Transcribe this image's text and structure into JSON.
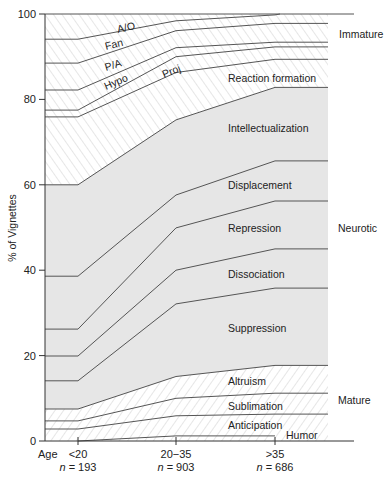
{
  "chart_data": {
    "type": "area",
    "title": "",
    "xlabel": "Age",
    "ylabel": "% of Vignettes",
    "ylim": [
      0,
      100
    ],
    "yticks": [
      0,
      20,
      40,
      60,
      80,
      100
    ],
    "grid": false,
    "stacked": true,
    "categories": [
      "<20",
      "20−35",
      ">35"
    ],
    "sample_sizes": [
      "n = 193",
      "n = 903",
      "n = 686"
    ],
    "boundaries_top_to_bottom": [
      [
        100,
        100,
        100
      ],
      [
        94.1,
        98.4,
        99.8
      ],
      [
        88.5,
        96.1,
        97.8
      ],
      [
        82.2,
        92.1,
        93.4
      ],
      [
        77.5,
        90.0,
        92.3
      ],
      [
        75.9,
        86.3,
        89.4
      ],
      [
        60.0,
        75.2,
        82.8
      ],
      [
        38.6,
        57.6,
        65.6
      ],
      [
        26.2,
        49.9,
        56.2
      ],
      [
        19.9,
        40.0,
        45.0
      ],
      [
        14.1,
        32.1,
        35.8
      ],
      [
        7.5,
        15.1,
        17.7
      ],
      [
        4.7,
        10.0,
        11.2
      ],
      [
        2.8,
        5.9,
        6.3
      ],
      [
        0,
        1.2,
        1.2
      ],
      [
        0,
        0,
        0
      ]
    ],
    "series": [
      {
        "name": "A/O",
        "group": "Immature",
        "values": [
          5.9,
          1.6,
          0.2
        ]
      },
      {
        "name": "Fan",
        "group": "Immature",
        "values": [
          5.6,
          2.3,
          2.0
        ]
      },
      {
        "name": "P/A",
        "group": "Immature",
        "values": [
          6.3,
          4.0,
          4.4
        ]
      },
      {
        "name": "Hypo",
        "group": "Immature",
        "values": [
          4.7,
          2.1,
          1.1
        ]
      },
      {
        "name": "Proj",
        "group": "Immature",
        "values": [
          1.6,
          3.7,
          2.9
        ]
      },
      {
        "name": "Reaction formation",
        "group": "Neurotic",
        "values": [
          15.9,
          11.1,
          6.6
        ]
      },
      {
        "name": "Intellectualization",
        "group": "Neurotic",
        "values": [
          21.4,
          17.6,
          17.2
        ]
      },
      {
        "name": "Displacement",
        "group": "Neurotic",
        "values": [
          12.4,
          7.7,
          9.4
        ]
      },
      {
        "name": "Repression",
        "group": "Neurotic",
        "values": [
          6.3,
          9.9,
          11.2
        ]
      },
      {
        "name": "Dissociation",
        "group": "Neurotic",
        "values": [
          5.8,
          7.9,
          9.2
        ]
      },
      {
        "name": "Suppression",
        "group": "Mature",
        "values": [
          6.6,
          17.0,
          18.1
        ]
      },
      {
        "name": "Altruism",
        "group": "Mature",
        "values": [
          2.8,
          5.1,
          6.5
        ]
      },
      {
        "name": "Sublimation",
        "group": "Mature",
        "values": [
          1.9,
          4.1,
          4.9
        ]
      },
      {
        "name": "Anticipation",
        "group": "Mature",
        "values": [
          2.8,
          4.7,
          5.1
        ]
      },
      {
        "name": "Humor",
        "group": "Mature",
        "values": [
          0.0,
          1.2,
          1.2
        ]
      }
    ],
    "groups": [
      {
        "name": "Immature",
        "fill": "hatch-backslash"
      },
      {
        "name": "Neurotic",
        "fill": "#e6e6e6"
      },
      {
        "name": "Mature",
        "fill": "hatch-slash"
      }
    ]
  },
  "labels": {
    "ylabel": "% of Vignettes",
    "age": "Age",
    "yticks": [
      "0",
      "20",
      "40",
      "60",
      "80",
      "100"
    ],
    "cats": [
      "<20",
      "20−35",
      ">35"
    ],
    "n_prefix": "n",
    "n_values": [
      "= 193",
      "= 903",
      "= 686"
    ],
    "groups": [
      "Immature",
      "Neurotic",
      "Mature"
    ],
    "layers": {
      "ao": "A/O",
      "fan": "Fan",
      "pa": "P/A",
      "hypo": "Hypo",
      "proj": "Proj",
      "rf": "Reaction formation",
      "intel": "Intellectualization",
      "displ": "Displacement",
      "repr": "Repression",
      "dissoc": "Dissociation",
      "suppr": "Suppression",
      "altr": "Altruism",
      "sublim": "Sublimation",
      "antic": "Anticipation",
      "humor": "Humor"
    }
  },
  "colors": {
    "line": "#555555",
    "neurotic_fill": "#e6e6e6",
    "hatch": "#d4d4d4",
    "axis": "#333333"
  }
}
